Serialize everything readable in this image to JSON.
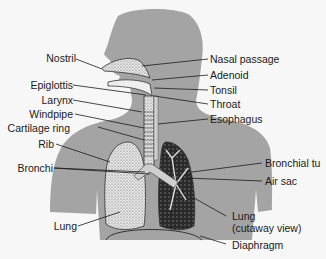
{
  "diagram": {
    "colors": {
      "background": "#f7f7f7",
      "silhouette": "#a4a4a4",
      "organ_fill": "#e6e6e6",
      "line": "#1a1a1a",
      "text": "#1a1a1a"
    },
    "labels_left": [
      {
        "id": "nostril",
        "text": "Nostril"
      },
      {
        "id": "epiglottis",
        "text": "Epiglottis"
      },
      {
        "id": "larynx",
        "text": "Larynx"
      },
      {
        "id": "windpipe",
        "text": "Windpipe"
      },
      {
        "id": "cartilage-ring",
        "text": "Cartilage ring"
      },
      {
        "id": "rib",
        "text": "Rib"
      },
      {
        "id": "bronchi",
        "text": "Bronchi"
      },
      {
        "id": "lung",
        "text": "Lung"
      }
    ],
    "labels_right": [
      {
        "id": "nasal-passage",
        "text": "Nasal passage"
      },
      {
        "id": "adenoid",
        "text": "Adenoid"
      },
      {
        "id": "tonsil",
        "text": "Tonsil"
      },
      {
        "id": "throat",
        "text": "Throat"
      },
      {
        "id": "esophagus",
        "text": "Esophagus"
      },
      {
        "id": "bronchial-tube",
        "text": "Bronchial tu"
      },
      {
        "id": "air-sac",
        "text": "Air sac"
      },
      {
        "id": "lung-cutaway",
        "text": "Lung",
        "subtext": "(cutaway view)"
      },
      {
        "id": "diaphragm",
        "text": "Diaphragm"
      }
    ]
  }
}
